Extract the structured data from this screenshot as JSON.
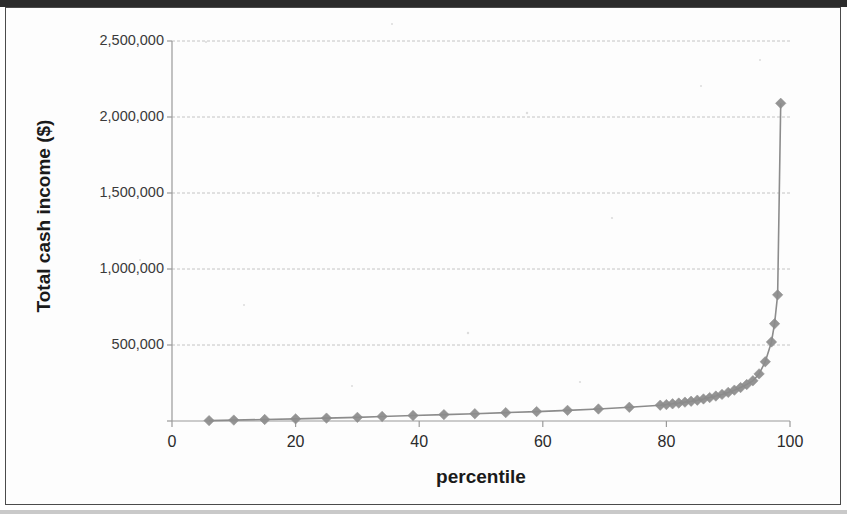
{
  "figure": {
    "background_color": "#fdfdfd",
    "frame_color": "#4a4a4a",
    "series_color": "#8c8c8c",
    "gridline_color": "#c4c4c4",
    "axis_color": "#9a9a9a",
    "text_color": "#1a1a1a"
  },
  "chart_data": {
    "type": "line",
    "title": "",
    "subtitle": "",
    "xlabel": "percentile",
    "ylabel": "Total cash income ($)",
    "xlim": [
      0,
      100
    ],
    "ylim": [
      0,
      2500000
    ],
    "xticks": [
      0,
      20,
      40,
      60,
      80,
      100
    ],
    "xtick_labels": [
      "0",
      "20",
      "40",
      "60",
      "80",
      "100"
    ],
    "yticks": [
      0,
      500000,
      1000000,
      1500000,
      2000000,
      2500000
    ],
    "ytick_labels": [
      "",
      "500,000",
      "1,000,000",
      "1,500,000",
      "2,000,000",
      "2,500,000"
    ],
    "grid": "horizontal",
    "grid_style": "dashed",
    "legend": "none",
    "legend_position": "none",
    "marker": "diamond",
    "marker_color": "#8c8c8c",
    "line_color": "#8c8c8c",
    "series": [
      {
        "name": "Total cash income",
        "x": [
          6,
          10,
          15,
          20,
          25,
          30,
          34,
          39,
          44,
          49,
          54,
          59,
          64,
          69,
          74,
          79,
          80,
          81,
          82,
          83,
          84,
          85,
          86,
          87,
          88,
          89,
          90,
          91,
          92,
          93,
          94,
          95,
          96,
          97,
          97.5,
          98,
          98.5
        ],
        "y": [
          2500,
          6000,
          10000,
          14000,
          19000,
          24000,
          30000,
          36000,
          42000,
          48000,
          55000,
          62000,
          70000,
          79000,
          90000,
          104000,
          108000,
          113000,
          118000,
          124000,
          130000,
          137000,
          145000,
          154000,
          164000,
          175000,
          188000,
          203000,
          220000,
          240000,
          265000,
          310000,
          390000,
          520000,
          640000,
          830000,
          2090000
        ]
      }
    ]
  }
}
